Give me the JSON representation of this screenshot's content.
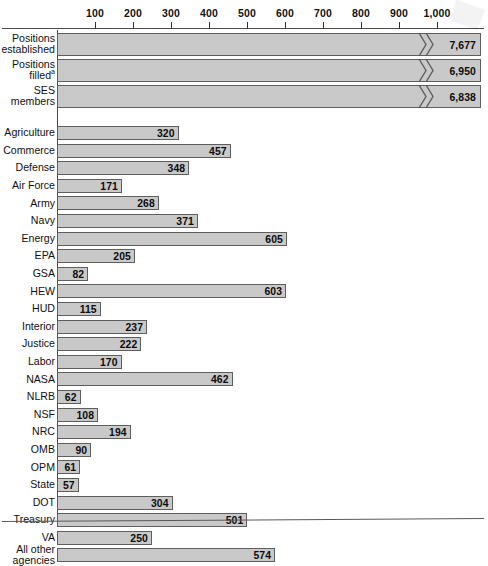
{
  "chart_data": {
    "type": "bar",
    "orientation": "horizontal",
    "title": "",
    "subtitle": "",
    "xlabel": "",
    "ylabel": "",
    "xlim": [
      0,
      1050
    ],
    "grid": false,
    "legend": null,
    "axis_ticks": [
      100,
      200,
      300,
      400,
      500,
      600,
      700,
      800,
      900,
      1000
    ],
    "axis_tick_labels": [
      "100",
      "200",
      "300",
      "400",
      "500",
      "600",
      "700",
      "800",
      "900",
      "1,000"
    ],
    "axis_break": {
      "present": true,
      "note": "Bars exceeding the 1,000 axis maximum are drawn with a double-chevron break symbol near the plot edge.",
      "symbol": "double-chevron"
    },
    "categories": [
      "Positions established",
      "Positions filled",
      "SES members",
      "Agriculture",
      "Commerce",
      "Defense",
      "Air Force",
      "Army",
      "Navy",
      "Energy",
      "EPA",
      "GSA",
      "HEW",
      "HUD",
      "Interior",
      "Justice",
      "Labor",
      "NASA",
      "NLRB",
      "NSF",
      "NRC",
      "OMB",
      "OPM",
      "State",
      "DOT",
      "Treasury",
      "VA",
      "All other agencies"
    ],
    "values": [
      7677,
      6950,
      6838,
      320,
      457,
      348,
      171,
      268,
      371,
      605,
      205,
      82,
      603,
      115,
      237,
      222,
      170,
      462,
      62,
      108,
      194,
      90,
      61,
      57,
      304,
      501,
      250,
      574
    ],
    "value_labels": [
      "7,677",
      "6,950",
      "6,838",
      "320",
      "457",
      "348",
      "171",
      "268",
      "371",
      "605",
      "205",
      "82",
      "603",
      "115",
      "237",
      "222",
      "170",
      "462",
      "62",
      "108",
      "194",
      "90",
      "61",
      "57",
      "304",
      "501",
      "250",
      "574"
    ]
  },
  "axis": {
    "ticks": [
      {
        "label": "100",
        "value": 100
      },
      {
        "label": "200",
        "value": 200
      },
      {
        "label": "300",
        "value": 300
      },
      {
        "label": "400",
        "value": 400
      },
      {
        "label": "500",
        "value": 500
      },
      {
        "label": "600",
        "value": 600
      },
      {
        "label": "700",
        "value": 700
      },
      {
        "label": "800",
        "value": 800
      },
      {
        "label": "900",
        "value": 900
      },
      {
        "label": "1,000",
        "value": 1000
      }
    ]
  },
  "rows": [
    {
      "label": "Positions\nestablished",
      "value": 7677,
      "value_label": "7,677",
      "group": "summary",
      "broken": true,
      "footnote": ""
    },
    {
      "label": "Positions\nfilled",
      "value": 6950,
      "value_label": "6,950",
      "group": "summary",
      "broken": true,
      "footnote": "a"
    },
    {
      "label": "SES\nmembers",
      "value": 6838,
      "value_label": "6,838",
      "group": "summary",
      "broken": true,
      "footnote": ""
    },
    {
      "label": "Agriculture",
      "value": 320,
      "value_label": "320",
      "group": "agency",
      "broken": false,
      "footnote": ""
    },
    {
      "label": "Commerce",
      "value": 457,
      "value_label": "457",
      "group": "agency",
      "broken": false,
      "footnote": ""
    },
    {
      "label": "Defense",
      "value": 348,
      "value_label": "348",
      "group": "agency",
      "broken": false,
      "footnote": ""
    },
    {
      "label": "Air Force",
      "value": 171,
      "value_label": "171",
      "group": "agency",
      "broken": false,
      "footnote": ""
    },
    {
      "label": "Army",
      "value": 268,
      "value_label": "268",
      "group": "agency",
      "broken": false,
      "footnote": ""
    },
    {
      "label": "Navy",
      "value": 371,
      "value_label": "371",
      "group": "agency",
      "broken": false,
      "footnote": ""
    },
    {
      "label": "Energy",
      "value": 605,
      "value_label": "605",
      "group": "agency",
      "broken": false,
      "footnote": ""
    },
    {
      "label": "EPA",
      "value": 205,
      "value_label": "205",
      "group": "agency",
      "broken": false,
      "footnote": ""
    },
    {
      "label": "GSA",
      "value": 82,
      "value_label": "82",
      "group": "agency",
      "broken": false,
      "footnote": ""
    },
    {
      "label": "HEW",
      "value": 603,
      "value_label": "603",
      "group": "agency",
      "broken": false,
      "footnote": ""
    },
    {
      "label": "HUD",
      "value": 115,
      "value_label": "115",
      "group": "agency",
      "broken": false,
      "footnote": ""
    },
    {
      "label": "Interior",
      "value": 237,
      "value_label": "237",
      "group": "agency",
      "broken": false,
      "footnote": ""
    },
    {
      "label": "Justice",
      "value": 222,
      "value_label": "222",
      "group": "agency",
      "broken": false,
      "footnote": ""
    },
    {
      "label": "Labor",
      "value": 170,
      "value_label": "170",
      "group": "agency",
      "broken": false,
      "footnote": ""
    },
    {
      "label": "NASA",
      "value": 462,
      "value_label": "462",
      "group": "agency",
      "broken": false,
      "footnote": ""
    },
    {
      "label": "NLRB",
      "value": 62,
      "value_label": "62",
      "group": "agency",
      "broken": false,
      "footnote": ""
    },
    {
      "label": "NSF",
      "value": 108,
      "value_label": "108",
      "group": "agency",
      "broken": false,
      "footnote": ""
    },
    {
      "label": "NRC",
      "value": 194,
      "value_label": "194",
      "group": "agency",
      "broken": false,
      "footnote": ""
    },
    {
      "label": "OMB",
      "value": 90,
      "value_label": "90",
      "group": "agency",
      "broken": false,
      "footnote": ""
    },
    {
      "label": "OPM",
      "value": 61,
      "value_label": "61",
      "group": "agency",
      "broken": false,
      "footnote": ""
    },
    {
      "label": "State",
      "value": 57,
      "value_label": "57",
      "group": "agency",
      "broken": false,
      "footnote": ""
    },
    {
      "label": "DOT",
      "value": 304,
      "value_label": "304",
      "group": "agency",
      "broken": false,
      "footnote": ""
    },
    {
      "label": "Treasury",
      "value": 501,
      "value_label": "501",
      "group": "agency",
      "broken": false,
      "footnote": ""
    },
    {
      "label": "VA",
      "value": 250,
      "value_label": "250",
      "group": "agency",
      "broken": false,
      "footnote": ""
    },
    {
      "label": "All other\nagencies",
      "value": 574,
      "value_label": "574",
      "group": "agency",
      "broken": false,
      "footnote": ""
    }
  ],
  "colors": {
    "bar_fill": "#c9c9c9",
    "bar_border": "#5e5e5e",
    "axis": "#4a4a4a",
    "text": "#0c0c0c",
    "background": "#ffffff"
  }
}
